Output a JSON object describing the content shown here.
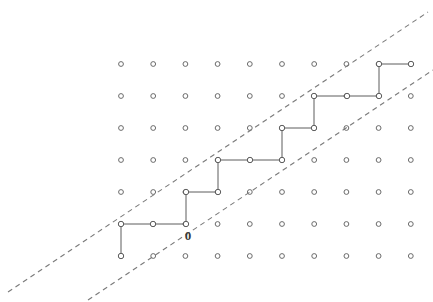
{
  "figure": {
    "type": "lattice-path-diagram",
    "background_color": "#ffffff",
    "width": 433,
    "height": 302
  },
  "labels": {
    "origin": "0"
  },
  "chart_data": {
    "type": "scatter",
    "xlabel": "",
    "ylabel": "",
    "grid": true,
    "legend_position": "none",
    "lattice": {
      "description": "Rectangular grid of small open-circle lattice points",
      "columns": 10,
      "rows": 7,
      "x_start_px": 121,
      "y_start_px": 64,
      "x_spacing_px": 32.2,
      "y_spacing_px": 32.0,
      "dot_radius_px": 2.4,
      "dot_stroke_color": "#6b6b6b",
      "dot_fill_color": "#ffffff"
    },
    "path": {
      "name": "staircase-lattice-path",
      "stroke_color": "#5d5d5d",
      "vertex_marker": "open-circle",
      "description": "Monotone staircase path of unit up and right steps, drawn in lattice (col,row) indices where col 0 is leftmost and row 0 is the top row",
      "vertices_grid": [
        [
          0,
          6
        ],
        [
          0,
          5
        ],
        [
          1,
          5
        ],
        [
          2,
          5
        ],
        [
          2,
          4
        ],
        [
          3,
          4
        ],
        [
          3,
          3
        ],
        [
          4,
          3
        ],
        [
          5,
          3
        ],
        [
          5,
          2
        ],
        [
          6,
          2
        ],
        [
          6,
          1
        ],
        [
          7,
          1
        ],
        [
          8,
          1
        ],
        [
          8,
          0
        ],
        [
          9,
          0
        ]
      ],
      "vertices_px": [
        [
          121,
          256
        ],
        [
          121,
          224
        ],
        [
          153,
          224
        ],
        [
          186,
          224
        ],
        [
          186,
          192
        ],
        [
          218,
          192
        ],
        [
          218,
          160
        ],
        [
          250,
          160
        ],
        [
          282,
          160
        ],
        [
          282,
          128
        ],
        [
          314,
          128
        ],
        [
          314,
          96
        ],
        [
          347,
          96
        ],
        [
          379,
          96
        ],
        [
          379,
          64
        ],
        [
          411,
          64
        ]
      ]
    },
    "boundary_lines": [
      {
        "name": "upper-boundary",
        "style": "dashed",
        "slope": 0.667,
        "stroke_color": "#7a7a7a",
        "endpoints_px": [
          [
            8,
            292
          ],
          [
            428,
            12
          ]
        ]
      },
      {
        "name": "lower-boundary",
        "style": "dashed",
        "slope": 0.667,
        "stroke_color": "#7a7a7a",
        "endpoints_px": [
          [
            88,
            300
          ],
          [
            433,
            70
          ]
        ]
      }
    ],
    "annotations": [
      {
        "text": "0",
        "x_px": 188,
        "y_px": 240,
        "anchor": "middle",
        "describes": "origin lattice point of the path"
      }
    ]
  }
}
